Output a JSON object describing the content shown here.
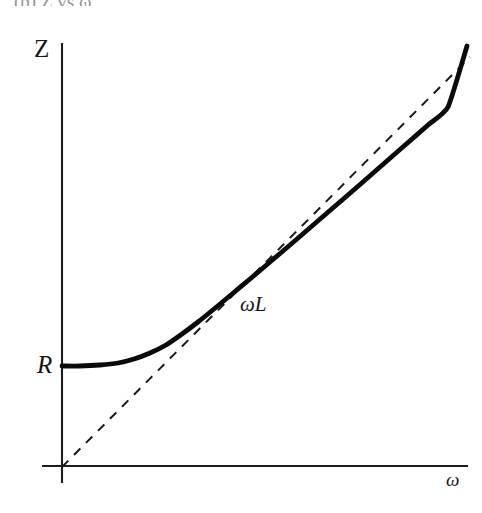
{
  "figure": {
    "caption_cropped": "(b) Z vs ω",
    "background_color": "#ffffff",
    "ink_color": "#111111"
  },
  "labels": {
    "y_axis": "Z",
    "x_axis": "ω",
    "intercept": "R",
    "asymptote": "ωL"
  },
  "chart_data": {
    "type": "line",
    "title": "",
    "subtitle": "",
    "xlabel": "ω",
    "ylabel": "Z",
    "grid": false,
    "legend": null,
    "axis_style": "bare-arrowless-axes",
    "annotations": [
      {
        "text": "R",
        "role": "y-intercept-label",
        "x_px": 46,
        "y_px": 366
      },
      {
        "text": "ωL",
        "role": "asymptote-label",
        "x_px": 252,
        "y_px": 305
      },
      {
        "text": "Z",
        "role": "y-axis-label",
        "x_px": 44,
        "y_px": 48
      },
      {
        "text": "ω",
        "role": "x-axis-label",
        "x_px": 453,
        "y_px": 480
      }
    ],
    "axes_px": {
      "origin": [
        62,
        467
      ],
      "y_axis_top": [
        62,
        43
      ],
      "y_axis_bottom": [
        62,
        483
      ],
      "x_axis_left": [
        42,
        466
      ],
      "x_axis_right": [
        468,
        466
      ]
    },
    "series": [
      {
        "name": "Z = sqrt(R^2 + (ωL)^2)",
        "style": "solid-thick",
        "color": "#0b0b0b",
        "points_px": [
          [
            62,
            366
          ],
          [
            80,
            366
          ],
          [
            100,
            365
          ],
          [
            118,
            363
          ],
          [
            134,
            359
          ],
          [
            150,
            353
          ],
          [
            166,
            345
          ],
          [
            182,
            334
          ],
          [
            198,
            322
          ],
          [
            214,
            309
          ],
          [
            232,
            294
          ],
          [
            250,
            279
          ],
          [
            270,
            262
          ],
          [
            290,
            245
          ],
          [
            312,
            226
          ],
          [
            334,
            207
          ],
          [
            356,
            188
          ],
          [
            380,
            167
          ],
          [
            404,
            146
          ],
          [
            428,
            125
          ],
          [
            448,
            107
          ],
          [
            467,
            46
          ]
        ],
        "normalized": {
          "x": [
            0.0,
            0.1,
            0.2,
            0.3,
            0.4,
            0.5,
            0.6,
            0.8,
            1.0,
            1.3,
            1.6,
            2.0,
            2.5,
            3.0,
            3.6,
            4.2
          ],
          "y": [
            1.0,
            1.005,
            1.02,
            1.044,
            1.077,
            1.118,
            1.166,
            1.281,
            1.414,
            1.64,
            1.887,
            2.236,
            2.693,
            3.162,
            3.736,
            4.317
          ],
          "formula": "Z(ω) = sqrt(R^2 + (ωL)^2)"
        }
      },
      {
        "name": "ωL",
        "style": "dashed",
        "color": "#1a1a1a",
        "points_px": [
          [
            62,
            467
          ],
          [
            470,
            57
          ]
        ],
        "normalized": {
          "formula": "Z = ωL (asymptote through origin)"
        }
      }
    ],
    "xlim": [
      0,
      4.4
    ],
    "ylim": [
      0,
      4.6
    ]
  }
}
